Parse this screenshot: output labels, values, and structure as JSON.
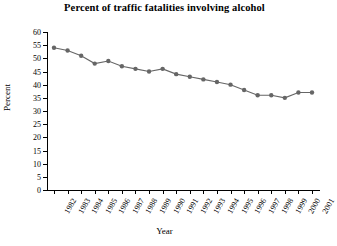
{
  "chart_data": {
    "type": "line",
    "title": "Percent of traffic fatalities involving alcohol",
    "xlabel": "Year",
    "ylabel": "Percent",
    "x": [
      1982,
      1983,
      1984,
      1985,
      1986,
      1987,
      1988,
      1989,
      1990,
      1991,
      1992,
      1993,
      1994,
      1995,
      1996,
      1997,
      1998,
      1999,
      2000,
      2001
    ],
    "categories": [
      "1982",
      "1983",
      "1984",
      "1985",
      "1986",
      "1987",
      "1988",
      "1989",
      "1990",
      "1991",
      "1992",
      "1993",
      "1994",
      "1995",
      "1996",
      "1997",
      "1998",
      "1999",
      "2000",
      "2001"
    ],
    "values": [
      54,
      53,
      51,
      48,
      49,
      47,
      46,
      45,
      46,
      44,
      43,
      42,
      41,
      40,
      38,
      36,
      36,
      35,
      37,
      37
    ],
    "series": [
      {
        "name": "Percent of traffic fatalities involving alcohol",
        "values": [
          54,
          53,
          51,
          48,
          49,
          47,
          46,
          45,
          46,
          44,
          43,
          42,
          41,
          40,
          38,
          36,
          36,
          35,
          37,
          37
        ]
      }
    ],
    "ylim": [
      0,
      60
    ],
    "yticks": [
      0,
      5,
      10,
      15,
      20,
      25,
      30,
      35,
      40,
      45,
      50,
      55,
      60
    ],
    "ytick_labels": [
      "0",
      "5",
      "10",
      "15",
      "20",
      "25",
      "30",
      "35",
      "40",
      "45",
      "50",
      "55",
      "60"
    ],
    "xlim": [
      1982,
      2001
    ],
    "grid": false,
    "legend": false,
    "legend_position": "none",
    "marker": "circle",
    "line_color": "#666666",
    "marker_color": "#666666",
    "axis_color": "#000000",
    "background": "#ffffff"
  }
}
